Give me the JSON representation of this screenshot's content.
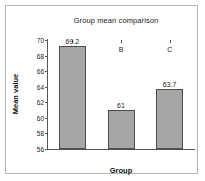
{
  "chart_data": {
    "type": "bar",
    "title": "Group mean comparison",
    "xlabel": "Group",
    "ylabel": "Mean value",
    "categories": [
      "A",
      "B",
      "C"
    ],
    "values": [
      69.2,
      61,
      63.7
    ],
    "data_labels": [
      "69.2",
      "61",
      "63.7"
    ],
    "ylim": [
      56,
      70
    ],
    "yticks": [
      70,
      68,
      66,
      64,
      62,
      60,
      58,
      56
    ],
    "ytick_labels": [
      "70",
      "68",
      "66",
      "64",
      "62",
      "60",
      "58",
      "56"
    ],
    "grid": false,
    "legend": false,
    "bar_fill_color": "#a6a6a6",
    "bar_edge_color": "#4d4d4d",
    "axis_color": "#555555",
    "frame_color": "#b4b4b4",
    "background_color": "#ffffff"
  }
}
